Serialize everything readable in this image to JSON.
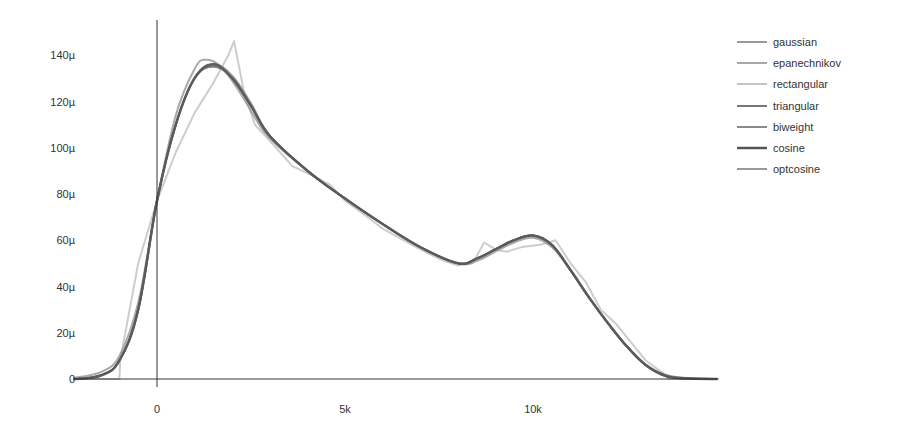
{
  "chart_data": {
    "type": "line",
    "title": "",
    "xlabel": "",
    "ylabel": "",
    "xlim": [
      -2200,
      14900
    ],
    "ylim": [
      0,
      0.00015
    ],
    "grid": false,
    "legend_position": "top-right",
    "x_ticks": [
      {
        "value": 0,
        "label": "0"
      },
      {
        "value": 5000,
        "label": "5k"
      },
      {
        "value": 10000,
        "label": "10k"
      }
    ],
    "y_ticks": [
      {
        "value": 0,
        "label": "0"
      },
      {
        "value": 2e-05,
        "label": "20µ"
      },
      {
        "value": 4e-05,
        "label": "40µ"
      },
      {
        "value": 6e-05,
        "label": "60µ"
      },
      {
        "value": 8e-05,
        "label": "80µ"
      },
      {
        "value": 0.0001,
        "label": "100µ"
      },
      {
        "value": 0.00012,
        "label": "120µ"
      },
      {
        "value": 0.00014,
        "label": "140µ"
      }
    ],
    "x_thousands": [
      -2.2,
      -1.5,
      -1,
      -0.5,
      0,
      0.5,
      1,
      1.5,
      2,
      2.5,
      3,
      4,
      5,
      6,
      7,
      8,
      8.5,
      9,
      9.5,
      10,
      10.5,
      11,
      11.5,
      12,
      12.5,
      13,
      13.5,
      14,
      14.9
    ],
    "series": [
      {
        "name": "gaussian",
        "color": "#9a9a9a",
        "width": 2,
        "x": [
          -2.2,
          -1.5,
          -1,
          -0.5,
          0,
          0.5,
          1,
          1.3,
          1.7,
          2.2,
          2.6,
          3,
          4,
          5,
          6,
          7,
          8,
          8.5,
          9,
          9.5,
          10,
          10.5,
          11,
          11.5,
          12,
          12.5,
          13,
          13.5,
          14,
          14.9
        ],
        "values_micro": [
          0.5,
          3,
          10,
          33,
          77,
          114,
          134,
          138,
          135,
          124,
          113,
          104,
          90,
          78,
          67,
          57,
          50,
          51,
          55,
          59,
          61,
          57,
          47,
          35,
          24,
          14,
          6,
          2,
          0.5,
          0
        ]
      },
      {
        "name": "epanechnikov",
        "color": "#a8a8a8",
        "width": 2,
        "x": [
          -2.2,
          -1.5,
          -1,
          -0.5,
          0,
          0.5,
          1,
          1.5,
          2,
          2.5,
          3,
          4,
          5,
          6,
          7,
          8,
          8.5,
          9,
          9.5,
          10,
          10.5,
          11,
          11.5,
          12,
          12.5,
          13,
          13.5,
          14,
          14.9
        ],
        "values_micro": [
          0,
          1.5,
          8,
          30,
          77,
          110,
          130,
          136,
          131,
          119,
          105,
          90,
          78,
          67,
          57,
          50,
          52,
          56,
          60,
          62,
          58,
          47,
          35,
          24,
          14,
          6,
          1.5,
          0.2,
          0
        ]
      },
      {
        "name": "rectangular",
        "color": "#c4c4c4",
        "width": 2,
        "x": [
          -2.2,
          -1.0,
          -0.98,
          -0.5,
          0,
          0.5,
          1,
          1.5,
          1.9,
          2.05,
          2.3,
          2.6,
          3,
          3.6,
          4,
          4.6,
          5,
          5.6,
          6,
          7,
          7.5,
          8,
          8.4,
          8.7,
          9,
          9.3,
          9.7,
          10.2,
          10.6,
          11,
          11.4,
          11.8,
          12.2,
          12.7,
          13,
          13.5,
          13.6,
          14.9
        ],
        "values_micro": [
          0,
          0,
          8,
          50,
          77,
          98,
          115,
          128,
          140,
          146,
          125,
          110,
          103,
          92,
          89,
          84,
          77,
          70,
          65,
          56,
          52,
          49,
          50,
          59,
          56,
          55,
          57,
          58,
          60,
          50,
          42,
          30,
          24,
          14,
          8,
          2,
          0,
          0
        ]
      },
      {
        "name": "triangular",
        "color": "#777777",
        "width": 2,
        "x": [
          -2.2,
          -1.5,
          -1,
          -0.5,
          0,
          0.5,
          1,
          1.5,
          2,
          2.5,
          3,
          4,
          5,
          6,
          7,
          8,
          8.5,
          9,
          9.5,
          10,
          10.5,
          11,
          11.5,
          12,
          12.5,
          13,
          13.5,
          14,
          14.9
        ],
        "values_micro": [
          0,
          1.5,
          8,
          30,
          77,
          110,
          130,
          135,
          130,
          118,
          105,
          90,
          78,
          67,
          57,
          50,
          52,
          56,
          60,
          62,
          58,
          47,
          35,
          24,
          14,
          6,
          1.5,
          0.3,
          0
        ]
      },
      {
        "name": "biweight",
        "color": "#8a8a8a",
        "width": 2,
        "x": [
          -2.2,
          -1.5,
          -1,
          -0.5,
          0,
          0.5,
          1,
          1.5,
          2,
          2.5,
          3,
          4,
          5,
          6,
          7,
          8,
          8.5,
          9,
          9.5,
          10,
          10.5,
          11,
          11.5,
          12,
          12.5,
          13,
          13.5,
          14,
          14.9
        ],
        "values_micro": [
          0,
          1.5,
          8,
          30,
          77,
          110,
          130,
          135,
          130,
          118,
          105,
          90,
          78,
          67,
          57,
          50,
          52,
          56,
          60,
          62,
          58,
          47,
          35,
          24,
          14,
          6,
          1.5,
          0.3,
          0
        ]
      },
      {
        "name": "cosine",
        "color": "#555555",
        "width": 2.5,
        "x": [
          -2.2,
          -1.5,
          -1,
          -0.5,
          0,
          0.5,
          1,
          1.5,
          2,
          2.5,
          3,
          4,
          5,
          6,
          7,
          8,
          8.5,
          9,
          9.5,
          10,
          10.5,
          11,
          11.5,
          12,
          12.5,
          13,
          13.5,
          14,
          14.9
        ],
        "values_micro": [
          0,
          1.5,
          8,
          30,
          77,
          110,
          130,
          136,
          130,
          118,
          105,
          90,
          78,
          67,
          57,
          50,
          52,
          56,
          60,
          62,
          58,
          47,
          35,
          24,
          14,
          6,
          1.5,
          0.3,
          0
        ]
      },
      {
        "name": "optcosine",
        "color": "#999999",
        "width": 2,
        "x": [
          -2.2,
          -1.5,
          -1,
          -0.5,
          0,
          0.5,
          1,
          1.5,
          2,
          2.5,
          3,
          4,
          5,
          6,
          7,
          8,
          8.5,
          9,
          9.5,
          10,
          10.5,
          11,
          11.5,
          12,
          12.5,
          13,
          13.5,
          14,
          14.9
        ],
        "values_micro": [
          0,
          1.5,
          8,
          30,
          77,
          110,
          130,
          136,
          131,
          119,
          105,
          90,
          78,
          67,
          57,
          50,
          52,
          56,
          60,
          62,
          58,
          47,
          35,
          24,
          14,
          6,
          1.5,
          0.2,
          0
        ]
      }
    ]
  },
  "legend": {
    "items": [
      {
        "label": "gaussian",
        "color": "#9a9a9a"
      },
      {
        "label": "epanechnikov",
        "color": "#a8a8a8"
      },
      {
        "label": "rectangular",
        "color": "#c4c4c4"
      },
      {
        "label": "triangular",
        "color": "#777777"
      },
      {
        "label": "biweight",
        "color": "#8a8a8a"
      },
      {
        "label": "cosine",
        "color": "#555555"
      },
      {
        "label": "optcosine",
        "color": "#999999"
      }
    ]
  },
  "axis_color": "#333333"
}
